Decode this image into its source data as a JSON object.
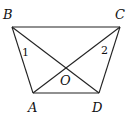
{
  "diagram": {
    "points": {
      "A": {
        "label": "A",
        "x": 33,
        "y": 93
      },
      "B": {
        "label": "B",
        "x": 12,
        "y": 27
      },
      "C": {
        "label": "C",
        "x": 120,
        "y": 27
      },
      "D": {
        "label": "D",
        "x": 99,
        "y": 93
      },
      "O": {
        "label": "O",
        "x": 65,
        "y": 69
      }
    },
    "segments": [
      "BC",
      "AD",
      "AB",
      "CD",
      "BD",
      "AC"
    ],
    "angle_labels": [
      {
        "label": "1",
        "at": "B"
      },
      {
        "label": "2",
        "at": "C"
      }
    ],
    "line_color": "#222222"
  }
}
